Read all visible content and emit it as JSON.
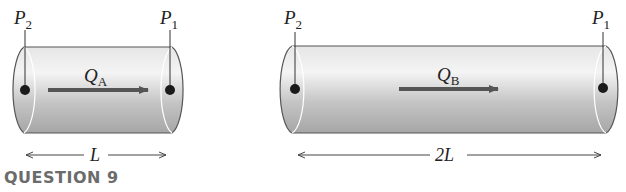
{
  "figure": {
    "pipe_a": {
      "left_point": "P",
      "left_point_sub": "2",
      "right_point": "P",
      "right_point_sub": "1",
      "flow_label": "Q",
      "flow_label_sub": "A",
      "length_label": "L"
    },
    "pipe_b": {
      "left_point": "P",
      "left_point_sub": "2",
      "right_point": "P",
      "right_point_sub": "1",
      "flow_label": "Q",
      "flow_label_sub": "B",
      "length_label": "2L"
    }
  },
  "question": {
    "label": "QUESTION 9"
  },
  "colors": {
    "pipe_light": "#ececec",
    "pipe_dark": "#a9a9a9",
    "outline": "#555555",
    "arrow": "#555555",
    "question": "#6b6b6b"
  }
}
